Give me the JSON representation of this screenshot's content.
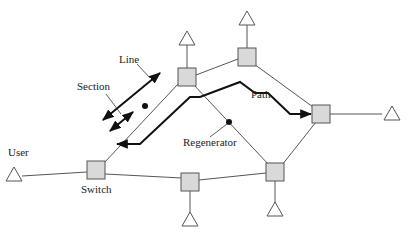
{
  "diagram": {
    "type": "network-topology",
    "colors": {
      "node_fill": "#d9d9d9",
      "node_stroke": "#555555",
      "link": "#555555",
      "path": "#111111",
      "background": "#ffffff"
    },
    "labels": {
      "user": "User",
      "switch": "Switch",
      "line": "Line",
      "section": "Section",
      "path": "Path",
      "regenerator": "Regenerator"
    },
    "nodes": [
      {
        "id": "switch",
        "shape": "square",
        "x": 96,
        "y": 170
      },
      {
        "id": "node-a",
        "shape": "square",
        "x": 187,
        "y": 77
      },
      {
        "id": "node-b",
        "shape": "square",
        "x": 247,
        "y": 57
      },
      {
        "id": "node-c",
        "shape": "square",
        "x": 321,
        "y": 114
      },
      {
        "id": "node-d",
        "shape": "square",
        "x": 275,
        "y": 172
      },
      {
        "id": "node-e",
        "shape": "square",
        "x": 190,
        "y": 182
      }
    ],
    "terminals": [
      {
        "id": "user",
        "shape": "triangle",
        "x": 14,
        "y": 176,
        "attached_to": "switch"
      },
      {
        "id": "term-a",
        "shape": "triangle",
        "x": 187,
        "y": 38,
        "attached_to": "node-a"
      },
      {
        "id": "term-b",
        "shape": "triangle",
        "x": 247,
        "y": 18,
        "attached_to": "node-b"
      },
      {
        "id": "term-c",
        "shape": "triangle",
        "x": 392,
        "y": 114,
        "attached_to": "node-c"
      },
      {
        "id": "term-d",
        "shape": "triangle",
        "x": 275,
        "y": 212,
        "attached_to": "node-d"
      },
      {
        "id": "term-e",
        "shape": "triangle",
        "x": 190,
        "y": 222,
        "attached_to": "node-e"
      }
    ],
    "links": [
      [
        "switch",
        "node-a"
      ],
      [
        "node-a",
        "node-b"
      ],
      [
        "node-b",
        "node-c"
      ],
      [
        "node-a",
        "node-d"
      ],
      [
        "node-c",
        "node-d"
      ],
      [
        "node-d",
        "node-e"
      ],
      [
        "node-e",
        "switch"
      ]
    ],
    "path_route": [
      "node-c",
      "node-b-below",
      "node-a-below",
      "switch"
    ],
    "regenerators": [
      {
        "id": "regen-1",
        "x": 229,
        "y": 122
      },
      {
        "id": "regen-2",
        "x": 145,
        "y": 106
      }
    ]
  }
}
